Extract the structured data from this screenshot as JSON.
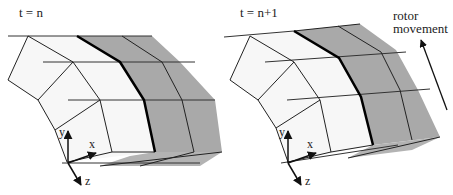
{
  "panels": [
    {
      "title": "t = n",
      "axes": {
        "x": "x",
        "y": "y",
        "z": "z"
      }
    },
    {
      "title": "t = n+1",
      "axes": {
        "x": "x",
        "y": "y",
        "z": "z"
      }
    }
  ],
  "annotation": {
    "line1": "rotor",
    "line2": "movement"
  },
  "colors": {
    "light_face": "#f7f7f7",
    "grey_face": "#a8a8a8",
    "grey_bottom": "#b5b5b5",
    "line": "#222222"
  }
}
